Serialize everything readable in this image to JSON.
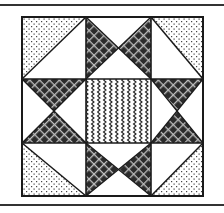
{
  "figure": {
    "frame": {
      "top_line_y": 5,
      "bottom_line_y": 205,
      "color": "#333333"
    },
    "grid": {
      "xs": [
        22,
        86,
        151,
        203
      ],
      "ys": [
        17,
        79,
        143,
        196
      ]
    },
    "colors": {
      "outline": "#1a1a1a",
      "white": "#ffffff",
      "dark_fill": "#2b2b2b",
      "crosshatch_line": "#bdbdbd",
      "dot": "#444444",
      "wave": "#222222"
    },
    "cells": [
      {
        "name": "corner-top-left",
        "type": "hst",
        "diagonal": "tr-bl",
        "patterned_half": "top-left",
        "pattern": "dots"
      },
      {
        "name": "edge-top",
        "type": "hourglass",
        "dark_sides": [
          "left",
          "right"
        ],
        "pattern": "crosshatch"
      },
      {
        "name": "corner-top-right",
        "type": "hst",
        "diagonal": "tl-br",
        "patterned_half": "top-right",
        "pattern": "dots"
      },
      {
        "name": "edge-left",
        "type": "hourglass",
        "dark_sides": [
          "top",
          "bottom"
        ],
        "pattern": "crosshatch"
      },
      {
        "name": "center",
        "type": "square",
        "pattern": "waves"
      },
      {
        "name": "edge-right",
        "type": "hourglass",
        "dark_sides": [
          "top",
          "bottom"
        ],
        "pattern": "crosshatch"
      },
      {
        "name": "corner-bottom-left",
        "type": "hst",
        "diagonal": "tl-br",
        "patterned_half": "bottom-left",
        "pattern": "dots"
      },
      {
        "name": "edge-bottom",
        "type": "hourglass",
        "dark_sides": [
          "left",
          "right"
        ],
        "pattern": "crosshatch"
      },
      {
        "name": "corner-bottom-right",
        "type": "hst",
        "diagonal": "tr-bl",
        "patterned_half": "bottom-right",
        "pattern": "dots"
      }
    ]
  }
}
